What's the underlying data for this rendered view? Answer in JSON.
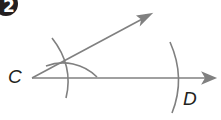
{
  "step": {
    "number": "2"
  },
  "labels": {
    "c": "C",
    "d": "D"
  },
  "colors": {
    "line": "#808080",
    "text": "#231f20",
    "badge": "#231f20"
  },
  "diagram": {
    "points": {
      "C": [
        32,
        78
      ],
      "D_arc_x": 176
    }
  }
}
